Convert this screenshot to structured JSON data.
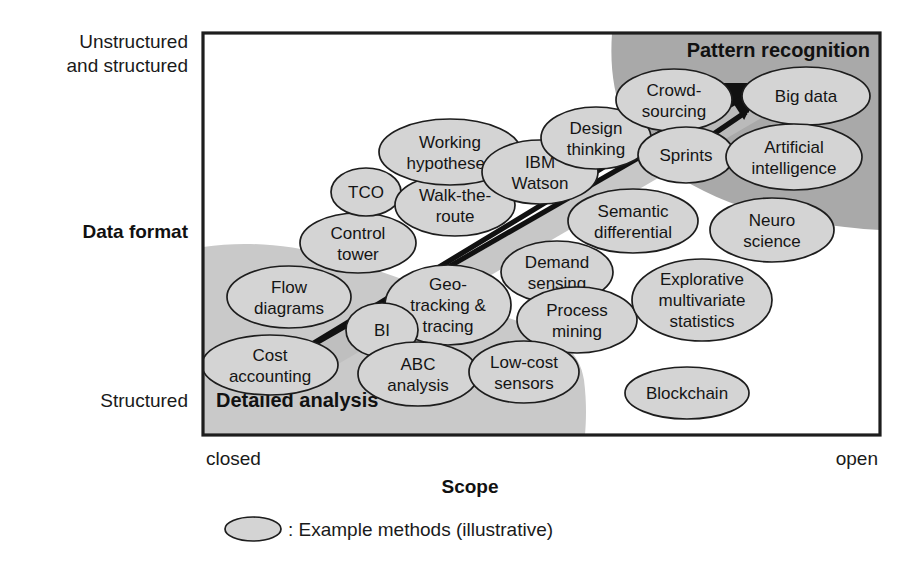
{
  "figure": {
    "type": "positioning-matrix",
    "background_color": "#ffffff"
  },
  "axes": {
    "y": {
      "title": "Data format",
      "top_label_line1": "Unstructured",
      "top_label_line2": "and structured",
      "bottom_label": "Structured"
    },
    "x": {
      "title": "Scope",
      "left_label": "closed",
      "right_label": "open"
    }
  },
  "zones": [
    {
      "id": "pattern-recognition",
      "label": "Pattern recognition",
      "color": "#a9a9a9",
      "position": "top-right"
    },
    {
      "id": "detailed-analysis",
      "label": "Detailed analysis",
      "color": "#c9c9c9",
      "position": "bottom-left"
    }
  ],
  "arrow": {
    "color": "#111111",
    "direction": "from bottom-left to top-right"
  },
  "nodes": [
    {
      "id": "cost-accounting",
      "lines": [
        "Cost",
        "accounting"
      ],
      "cx": 270,
      "cy": 365,
      "rx": 68,
      "ry": 30
    },
    {
      "id": "flow-diagrams",
      "lines": [
        "Flow",
        "diagrams"
      ],
      "cx": 289,
      "cy": 297,
      "rx": 62,
      "ry": 31
    },
    {
      "id": "control-tower",
      "lines": [
        "Control",
        "tower"
      ],
      "cx": 358,
      "cy": 243,
      "rx": 58,
      "ry": 30
    },
    {
      "id": "tco",
      "lines": [
        "TCO"
      ],
      "cx": 366,
      "cy": 192,
      "rx": 35,
      "ry": 24
    },
    {
      "id": "walk-the-route",
      "lines": [
        "Walk-the-",
        "route"
      ],
      "cx": 455,
      "cy": 205,
      "rx": 60,
      "ry": 31
    },
    {
      "id": "working-hypotheses",
      "lines": [
        "Working",
        "hypotheses"
      ],
      "cx": 450,
      "cy": 152,
      "rx": 71,
      "ry": 33
    },
    {
      "id": "ibm-watson",
      "lines": [
        "IBM",
        "Watson"
      ],
      "cx": 540,
      "cy": 172,
      "rx": 58,
      "ry": 32
    },
    {
      "id": "design-thinking",
      "lines": [
        "Design",
        "thinking"
      ],
      "cx": 596,
      "cy": 138,
      "rx": 55,
      "ry": 31
    },
    {
      "id": "crowd-sourcing",
      "lines": [
        "Crowd-",
        "sourcing"
      ],
      "cx": 674,
      "cy": 100,
      "rx": 58,
      "ry": 31
    },
    {
      "id": "big-data",
      "lines": [
        "Big data"
      ],
      "cx": 806,
      "cy": 96,
      "rx": 64,
      "ry": 29
    },
    {
      "id": "sprints",
      "lines": [
        "Sprints"
      ],
      "cx": 686,
      "cy": 155,
      "rx": 48,
      "ry": 28
    },
    {
      "id": "artificial-intelligence",
      "lines": [
        "Artificial",
        "intelligence"
      ],
      "cx": 794,
      "cy": 157,
      "rx": 68,
      "ry": 33
    },
    {
      "id": "semantic-differential",
      "lines": [
        "Semantic",
        "differential"
      ],
      "cx": 633,
      "cy": 221,
      "rx": 65,
      "ry": 32
    },
    {
      "id": "neuro-science",
      "lines": [
        "Neuro",
        "science"
      ],
      "cx": 772,
      "cy": 230,
      "rx": 62,
      "ry": 32
    },
    {
      "id": "demand-sensing",
      "lines": [
        "Demand",
        "sensing"
      ],
      "cx": 557,
      "cy": 272,
      "rx": 56,
      "ry": 31
    },
    {
      "id": "geo-tracking-tracing",
      "lines": [
        "Geo-",
        "tracking &",
        "tracing"
      ],
      "cx": 448,
      "cy": 305,
      "rx": 63,
      "ry": 40
    },
    {
      "id": "process-mining",
      "lines": [
        "Process",
        "mining"
      ],
      "cx": 577,
      "cy": 320,
      "rx": 60,
      "ry": 33
    },
    {
      "id": "explorative-stats",
      "lines": [
        "Explorative",
        "multivariate",
        "statistics"
      ],
      "cx": 702,
      "cy": 300,
      "rx": 70,
      "ry": 41
    },
    {
      "id": "bi",
      "lines": [
        "BI"
      ],
      "cx": 382,
      "cy": 330,
      "rx": 36,
      "ry": 27
    },
    {
      "id": "abc-analysis",
      "lines": [
        "ABC",
        "analysis"
      ],
      "cx": 418,
      "cy": 374,
      "rx": 60,
      "ry": 32
    },
    {
      "id": "low-cost-sensors",
      "lines": [
        "Low-cost",
        "sensors"
      ],
      "cx": 524,
      "cy": 372,
      "rx": 55,
      "ry": 31
    },
    {
      "id": "blockchain",
      "lines": [
        "Blockchain"
      ],
      "cx": 687,
      "cy": 393,
      "rx": 62,
      "ry": 26
    }
  ],
  "legend": {
    "swatch": "ellipse-swatch",
    "text": ": Example methods (illustrative)"
  }
}
